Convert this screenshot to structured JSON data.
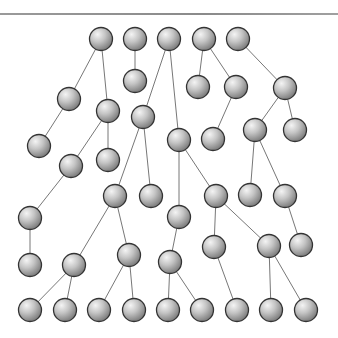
{
  "diagram": {
    "type": "forest",
    "colors": {
      "node_light": "#f2f2f2",
      "node_mid": "#bdbdbd",
      "node_dark": "#7a7a7a",
      "stroke": "#333333",
      "edge": "#777777",
      "rule": "#8f8f8f"
    },
    "node_radius": 11.5,
    "nodes": [
      {
        "id": 1,
        "x": 101,
        "y": 39
      },
      {
        "id": 2,
        "x": 135,
        "y": 39
      },
      {
        "id": 3,
        "x": 169,
        "y": 39
      },
      {
        "id": 4,
        "x": 204,
        "y": 39
      },
      {
        "id": 5,
        "x": 238,
        "y": 39
      },
      {
        "id": 6,
        "x": 135,
        "y": 81
      },
      {
        "id": 7,
        "x": 69,
        "y": 99
      },
      {
        "id": 8,
        "x": 108,
        "y": 111
      },
      {
        "id": 9,
        "x": 143,
        "y": 117
      },
      {
        "id": 10,
        "x": 198,
        "y": 87
      },
      {
        "id": 11,
        "x": 236,
        "y": 87
      },
      {
        "id": 12,
        "x": 285,
        "y": 88
      },
      {
        "id": 13,
        "x": 39,
        "y": 146
      },
      {
        "id": 14,
        "x": 108,
        "y": 160
      },
      {
        "id": 15,
        "x": 179,
        "y": 140
      },
      {
        "id": 16,
        "x": 213,
        "y": 139
      },
      {
        "id": 17,
        "x": 255,
        "y": 130
      },
      {
        "id": 18,
        "x": 295,
        "y": 130
      },
      {
        "id": 19,
        "x": 71,
        "y": 166
      },
      {
        "id": 20,
        "x": 115,
        "y": 196
      },
      {
        "id": 21,
        "x": 151,
        "y": 196
      },
      {
        "id": 22,
        "x": 216,
        "y": 196
      },
      {
        "id": 23,
        "x": 250,
        "y": 195
      },
      {
        "id": 24,
        "x": 285,
        "y": 196
      },
      {
        "id": 25,
        "x": 30,
        "y": 218
      },
      {
        "id": 26,
        "x": 179,
        "y": 217
      },
      {
        "id": 27,
        "x": 214,
        "y": 247
      },
      {
        "id": 28,
        "x": 269,
        "y": 246
      },
      {
        "id": 29,
        "x": 301,
        "y": 245
      },
      {
        "id": 30,
        "x": 30,
        "y": 265
      },
      {
        "id": 31,
        "x": 74,
        "y": 265
      },
      {
        "id": 32,
        "x": 129,
        "y": 255
      },
      {
        "id": 33,
        "x": 170,
        "y": 262
      },
      {
        "id": 34,
        "x": 30,
        "y": 310
      },
      {
        "id": 35,
        "x": 65,
        "y": 310
      },
      {
        "id": 36,
        "x": 99,
        "y": 310
      },
      {
        "id": 37,
        "x": 134,
        "y": 310
      },
      {
        "id": 38,
        "x": 168,
        "y": 310
      },
      {
        "id": 39,
        "x": 202,
        "y": 310
      },
      {
        "id": 40,
        "x": 237,
        "y": 310
      },
      {
        "id": 41,
        "x": 271,
        "y": 310
      },
      {
        "id": 42,
        "x": 306,
        "y": 310
      }
    ],
    "edges": [
      [
        1,
        7
      ],
      [
        1,
        8
      ],
      [
        2,
        6
      ],
      [
        3,
        9
      ],
      [
        3,
        15
      ],
      [
        4,
        10
      ],
      [
        4,
        11
      ],
      [
        5,
        12
      ],
      [
        7,
        13
      ],
      [
        8,
        14
      ],
      [
        8,
        19
      ],
      [
        9,
        20
      ],
      [
        9,
        21
      ],
      [
        11,
        16
      ],
      [
        12,
        17
      ],
      [
        12,
        18
      ],
      [
        15,
        22
      ],
      [
        15,
        26
      ],
      [
        17,
        23
      ],
      [
        17,
        24
      ],
      [
        19,
        25
      ],
      [
        25,
        30
      ],
      [
        20,
        31
      ],
      [
        20,
        32
      ],
      [
        22,
        27
      ],
      [
        22,
        28
      ],
      [
        24,
        29
      ],
      [
        26,
        33
      ],
      [
        31,
        34
      ],
      [
        31,
        35
      ],
      [
        32,
        36
      ],
      [
        32,
        37
      ],
      [
        33,
        38
      ],
      [
        33,
        39
      ],
      [
        27,
        40
      ],
      [
        28,
        41
      ],
      [
        28,
        42
      ]
    ]
  }
}
